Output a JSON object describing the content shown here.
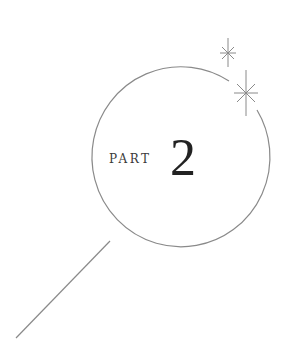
{
  "heading": {
    "label": "PART",
    "number": "2"
  },
  "colors": {
    "line": "#8a8a8a",
    "text": "#2a2a2a",
    "background": "#ffffff"
  },
  "icons": {
    "magnifier": "magnifying-glass-outline",
    "sparkles": [
      "sparkle-small",
      "sparkle-large"
    ]
  }
}
